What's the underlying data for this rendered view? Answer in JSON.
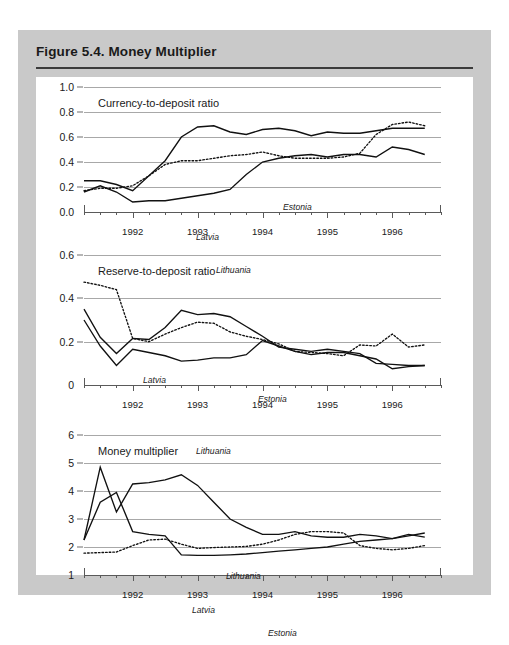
{
  "figure": {
    "title": "Figure 5.4.  Money Multiplier"
  },
  "series_names": {
    "estonia": "Estonia",
    "latvia": "Latvia",
    "lithuania": "Lithuania"
  },
  "panels": [
    {
      "id": "currency-to-deposit",
      "title": "Currency-to-deposit ratio",
      "ylim": [
        0.0,
        1.0
      ],
      "yticks": [
        0.0,
        0.2,
        0.4,
        0.6,
        0.8,
        1.0
      ],
      "ytick_labels": [
        "0.0",
        "0.2",
        "0.4",
        "0.6",
        "0.8",
        "1.0"
      ]
    },
    {
      "id": "reserve-to-deposit",
      "title": "Reserve-to-deposit ratio",
      "ylim": [
        0.0,
        0.6
      ],
      "yticks": [
        0.0,
        0.2,
        0.4,
        0.6
      ],
      "ytick_labels": [
        "0",
        "0.2",
        "0.4",
        "0.6"
      ]
    },
    {
      "id": "money-multiplier",
      "title": "Money multiplier",
      "ylim": [
        1,
        6
      ],
      "yticks": [
        1,
        2,
        3,
        4,
        5,
        6
      ],
      "ytick_labels": [
        "1",
        "2",
        "3",
        "4",
        "5",
        "6"
      ]
    }
  ],
  "xaxis": {
    "tick_labels": [
      "1992",
      "1993",
      "1994",
      "1995",
      "1996"
    ],
    "tick_values": [
      1992,
      1993,
      1994,
      1995,
      1996
    ],
    "range": [
      1991.25,
      1996.75
    ],
    "minor_ticks_per_year": 4
  },
  "chart_data": [
    {
      "type": "line",
      "title": "Currency-to-deposit ratio",
      "xlabel": "",
      "ylabel": "",
      "ylim": [
        0.0,
        1.0
      ],
      "xlim": [
        1991.25,
        1996.75
      ],
      "grid": true,
      "legend": "inline-annotations",
      "x": [
        1991.25,
        1991.5,
        1991.75,
        1992.0,
        1992.25,
        1992.5,
        1992.75,
        1993.0,
        1993.25,
        1993.5,
        1993.75,
        1994.0,
        1994.25,
        1994.5,
        1994.75,
        1995.0,
        1995.25,
        1995.5,
        1995.75,
        1996.0,
        1996.25,
        1996.5
      ],
      "series": [
        {
          "name": "Estonia",
          "style": "solid",
          "values": [
            0.25,
            0.25,
            0.22,
            0.17,
            0.29,
            0.41,
            0.6,
            0.68,
            0.69,
            0.64,
            0.62,
            0.66,
            0.67,
            0.65,
            0.61,
            0.64,
            0.63,
            0.63,
            0.65,
            0.67,
            0.67,
            0.67
          ]
        },
        {
          "name": "Latvia",
          "style": "dotted",
          "values": [
            0.17,
            0.19,
            0.19,
            0.21,
            0.29,
            0.38,
            0.41,
            0.41,
            0.43,
            0.45,
            0.46,
            0.48,
            0.45,
            0.43,
            0.43,
            0.43,
            0.44,
            0.47,
            0.62,
            0.7,
            0.72,
            0.69
          ]
        },
        {
          "name": "Lithuania",
          "style": "solid",
          "values": [
            0.16,
            0.21,
            0.16,
            0.08,
            0.09,
            0.09,
            0.11,
            0.13,
            0.15,
            0.18,
            0.3,
            0.4,
            0.43,
            0.45,
            0.46,
            0.44,
            0.46,
            0.46,
            0.44,
            0.52,
            0.5,
            0.46
          ]
        }
      ]
    },
    {
      "type": "line",
      "title": "Reserve-to-deposit ratio",
      "xlabel": "",
      "ylabel": "",
      "ylim": [
        0.0,
        0.6
      ],
      "xlim": [
        1991.25,
        1996.75
      ],
      "grid": true,
      "legend": "inline-annotations",
      "x": [
        1991.25,
        1991.5,
        1991.75,
        1992.0,
        1992.25,
        1992.5,
        1992.75,
        1993.0,
        1993.25,
        1993.5,
        1993.75,
        1994.0,
        1994.25,
        1994.5,
        1994.75,
        1995.0,
        1995.25,
        1995.5,
        1995.75,
        1996.0,
        1996.25,
        1996.5
      ],
      "series": [
        {
          "name": "Estonia",
          "style": "solid",
          "values": [
            0.35,
            0.22,
            0.145,
            0.215,
            0.21,
            0.265,
            0.345,
            0.325,
            0.33,
            0.315,
            0.27,
            0.225,
            0.175,
            0.165,
            0.155,
            0.165,
            0.155,
            0.145,
            0.1,
            0.095,
            0.09,
            0.09
          ]
        },
        {
          "name": "Latvia",
          "style": "dotted",
          "values": [
            0.475,
            0.46,
            0.44,
            0.215,
            0.2,
            0.235,
            0.265,
            0.29,
            0.285,
            0.245,
            0.225,
            0.21,
            0.19,
            0.155,
            0.15,
            0.145,
            0.135,
            0.185,
            0.18,
            0.235,
            0.175,
            0.185
          ]
        },
        {
          "name": "Lithuania",
          "style": "solid",
          "values": [
            0.3,
            0.18,
            0.09,
            0.165,
            0.15,
            0.135,
            0.11,
            0.115,
            0.125,
            0.125,
            0.14,
            0.205,
            0.18,
            0.155,
            0.14,
            0.15,
            0.15,
            0.135,
            0.12,
            0.075,
            0.085,
            0.09
          ]
        }
      ]
    },
    {
      "type": "line",
      "title": "Money multiplier",
      "xlabel": "",
      "ylabel": "",
      "ylim": [
        1,
        6
      ],
      "xlim": [
        1991.25,
        1996.75
      ],
      "grid": true,
      "legend": "inline-annotations",
      "x": [
        1991.25,
        1991.5,
        1991.75,
        1992.0,
        1992.25,
        1992.5,
        1992.75,
        1993.0,
        1993.25,
        1993.5,
        1993.75,
        1994.0,
        1994.25,
        1994.5,
        1994.75,
        1995.0,
        1995.25,
        1995.5,
        1995.75,
        1996.0,
        1996.25,
        1996.5
      ],
      "series": [
        {
          "name": "Estonia",
          "style": "solid",
          "values": [
            2.25,
            3.6,
            3.95,
            2.55,
            2.45,
            2.4,
            1.72,
            1.7,
            1.7,
            1.72,
            1.75,
            1.8,
            1.85,
            1.9,
            1.95,
            2.0,
            2.1,
            2.2,
            2.25,
            2.3,
            2.4,
            2.5
          ]
        },
        {
          "name": "Latvia",
          "style": "dotted",
          "values": [
            1.78,
            1.8,
            1.82,
            2.05,
            2.25,
            2.28,
            2.1,
            1.95,
            1.98,
            2.0,
            2.02,
            2.1,
            2.25,
            2.45,
            2.55,
            2.55,
            2.5,
            2.05,
            1.95,
            1.9,
            1.95,
            2.05
          ]
        },
        {
          "name": "Lithuania",
          "style": "solid",
          "values": [
            2.25,
            4.85,
            3.25,
            4.25,
            4.3,
            4.4,
            4.58,
            4.2,
            3.6,
            3.0,
            2.7,
            2.45,
            2.45,
            2.55,
            2.4,
            2.35,
            2.35,
            2.45,
            2.4,
            2.3,
            2.45,
            2.35
          ]
        }
      ]
    }
  ],
  "annotations": [
    {
      "panel": 0,
      "series": "Estonia",
      "label": "Estonia",
      "x": 247,
      "y": 125
    },
    {
      "panel": 0,
      "series": "Latvia",
      "label": "Latvia",
      "x": 160,
      "y": 155
    },
    {
      "panel": 0,
      "series": "Lithuania",
      "label": "Lithuania",
      "x": 180,
      "y": 188
    },
    {
      "panel": 1,
      "series": "Latvia",
      "label": "Latvia",
      "x": 107,
      "y": 298
    },
    {
      "panel": 1,
      "series": "Estonia",
      "label": "Estonia",
      "x": 222,
      "y": 317
    },
    {
      "panel": 1,
      "series": "Lithuania",
      "label": "Lithuania",
      "x": 160,
      "y": 369
    },
    {
      "panel": 2,
      "series": "Lithuania",
      "label": "Lithuania",
      "x": 190,
      "y": 494
    },
    {
      "panel": 2,
      "series": "Latvia",
      "label": "Latvia",
      "x": 156,
      "y": 528
    },
    {
      "panel": 2,
      "series": "Estonia",
      "label": "Estonia",
      "x": 232,
      "y": 551
    }
  ],
  "colors": {
    "frame": "#c9c9c9",
    "card": "#ffffff",
    "ink": "#111111",
    "grid": "#a8a8a8",
    "axis": "#5a5a5a",
    "title": "#1a1a1a"
  }
}
